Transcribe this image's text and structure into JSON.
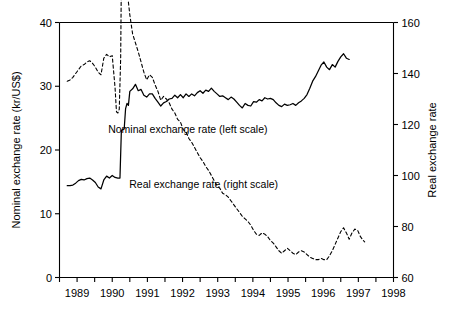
{
  "chart_data": {
    "type": "line",
    "title": "",
    "xlabel": "",
    "ylabel": "Nominal exchange rate (kr/US$)",
    "y2label": "Real exchange rate",
    "xlim": [
      1988.5,
      1998.0
    ],
    "ylim": [
      0,
      40
    ],
    "y2lim": [
      60,
      160
    ],
    "grid": false,
    "legend_position": "inside-annotations",
    "xticks": [
      1988.5,
      1989.0,
      1989.5,
      1990.0,
      1990.5,
      1991.0,
      1991.5,
      1992.0,
      1992.5,
      1993.0,
      1993.5,
      1994.0,
      1994.5,
      1995.0,
      1995.5,
      1996.0,
      1996.5,
      1997.0,
      1997.5,
      1998.0
    ],
    "xtick_labels": [
      "1989",
      "1990",
      "1991",
      "1992",
      "1993",
      "1994",
      "1995",
      "1996",
      "1997",
      "1998"
    ],
    "xtick_label_positions": [
      1989.0,
      1990.0,
      1991.0,
      1992.0,
      1993.0,
      1994.0,
      1995.0,
      1996.0,
      1997.0,
      1998.0
    ],
    "yticks": [
      0,
      10,
      20,
      30,
      40
    ],
    "ytick_labels": [
      "0",
      "10",
      "20",
      "30",
      "40"
    ],
    "y2ticks": [
      60,
      80,
      100,
      120,
      140,
      160
    ],
    "y2tick_labels": [
      "60",
      "80",
      "100",
      "120",
      "140",
      "160"
    ],
    "annotations": [
      {
        "text": "Nominal exchange rate (left scale)",
        "x": 1992.15,
        "y": 22.6
      },
      {
        "text": "Real exchange rate (right scale)",
        "x": 1992.6,
        "y": 14.1
      }
    ],
    "series": [
      {
        "name": "Nominal exchange rate (left scale)",
        "axis": "left",
        "style": "solid",
        "color": "#000000",
        "points": [
          [
            1988.72,
            14.4
          ],
          [
            1988.8,
            14.4
          ],
          [
            1988.88,
            14.5
          ],
          [
            1988.96,
            14.8
          ],
          [
            1989.04,
            15.2
          ],
          [
            1989.12,
            15.4
          ],
          [
            1989.2,
            15.3
          ],
          [
            1989.28,
            15.5
          ],
          [
            1989.36,
            15.6
          ],
          [
            1989.44,
            15.3
          ],
          [
            1989.52,
            14.9
          ],
          [
            1989.6,
            14.2
          ],
          [
            1989.68,
            13.9
          ],
          [
            1989.76,
            15.3
          ],
          [
            1989.84,
            15.9
          ],
          [
            1989.92,
            15.6
          ],
          [
            1990.0,
            16.0
          ],
          [
            1990.08,
            15.7
          ],
          [
            1990.16,
            15.6
          ],
          [
            1990.22,
            15.6
          ],
          [
            1990.26,
            23.1
          ],
          [
            1990.3,
            23.2
          ],
          [
            1990.34,
            23.3
          ],
          [
            1990.38,
            26.5
          ],
          [
            1990.42,
            27.3
          ],
          [
            1990.46,
            27.0
          ],
          [
            1990.5,
            29.2
          ],
          [
            1990.58,
            29.6
          ],
          [
            1990.66,
            30.3
          ],
          [
            1990.74,
            29.3
          ],
          [
            1990.82,
            29.5
          ],
          [
            1990.9,
            28.6
          ],
          [
            1990.98,
            28.3
          ],
          [
            1991.06,
            28.8
          ],
          [
            1991.14,
            28.8
          ],
          [
            1991.22,
            28.1
          ],
          [
            1991.3,
            27.5
          ],
          [
            1991.38,
            26.9
          ],
          [
            1991.46,
            27.4
          ],
          [
            1991.54,
            27.6
          ],
          [
            1991.62,
            28.0
          ],
          [
            1991.7,
            28.1
          ],
          [
            1991.78,
            28.6
          ],
          [
            1991.86,
            28.2
          ],
          [
            1991.94,
            28.7
          ],
          [
            1992.02,
            28.2
          ],
          [
            1992.1,
            28.8
          ],
          [
            1992.18,
            28.4
          ],
          [
            1992.26,
            28.8
          ],
          [
            1992.34,
            28.5
          ],
          [
            1992.42,
            29.0
          ],
          [
            1992.5,
            29.3
          ],
          [
            1992.58,
            28.9
          ],
          [
            1992.66,
            29.4
          ],
          [
            1992.74,
            29.2
          ],
          [
            1992.82,
            29.7
          ],
          [
            1992.9,
            29.2
          ],
          [
            1992.98,
            28.8
          ],
          [
            1993.06,
            28.4
          ],
          [
            1993.14,
            28.5
          ],
          [
            1993.22,
            28.2
          ],
          [
            1993.3,
            27.9
          ],
          [
            1993.38,
            28.3
          ],
          [
            1993.46,
            28.0
          ],
          [
            1993.54,
            27.5
          ],
          [
            1993.62,
            27.0
          ],
          [
            1993.7,
            26.6
          ],
          [
            1993.78,
            27.3
          ],
          [
            1993.86,
            27.0
          ],
          [
            1993.94,
            26.9
          ],
          [
            1994.02,
            27.6
          ],
          [
            1994.1,
            27.5
          ],
          [
            1994.18,
            27.9
          ],
          [
            1994.26,
            27.7
          ],
          [
            1994.34,
            28.2
          ],
          [
            1994.42,
            28.0
          ],
          [
            1994.5,
            28.1
          ],
          [
            1994.58,
            27.9
          ],
          [
            1994.66,
            27.4
          ],
          [
            1994.74,
            27.0
          ],
          [
            1994.82,
            26.8
          ],
          [
            1994.9,
            27.2
          ],
          [
            1994.98,
            27.0
          ],
          [
            1995.06,
            27.1
          ],
          [
            1995.14,
            27.3
          ],
          [
            1995.22,
            27.0
          ],
          [
            1995.3,
            27.4
          ],
          [
            1995.38,
            27.7
          ],
          [
            1995.46,
            28.1
          ],
          [
            1995.54,
            28.7
          ],
          [
            1995.62,
            29.7
          ],
          [
            1995.7,
            30.8
          ],
          [
            1995.78,
            31.5
          ],
          [
            1995.86,
            32.4
          ],
          [
            1995.94,
            33.3
          ],
          [
            1996.02,
            33.8
          ],
          [
            1996.1,
            33.0
          ],
          [
            1996.18,
            32.6
          ],
          [
            1996.26,
            33.4
          ],
          [
            1996.34,
            33.0
          ],
          [
            1996.42,
            33.9
          ],
          [
            1996.5,
            34.6
          ],
          [
            1996.58,
            35.1
          ],
          [
            1996.66,
            34.4
          ],
          [
            1996.74,
            34.2
          ]
        ]
      },
      {
        "name": "Real exchange rate (right scale)",
        "axis": "right",
        "style": "dashed",
        "color": "#000000",
        "points": [
          [
            1988.72,
            137.0
          ],
          [
            1988.8,
            137.5
          ],
          [
            1988.88,
            138.5
          ],
          [
            1988.96,
            140.0
          ],
          [
            1989.04,
            141.5
          ],
          [
            1989.12,
            143.0
          ],
          [
            1989.2,
            143.5
          ],
          [
            1989.28,
            144.5
          ],
          [
            1989.36,
            145.0
          ],
          [
            1989.44,
            144.0
          ],
          [
            1989.52,
            142.5
          ],
          [
            1989.6,
            140.5
          ],
          [
            1989.68,
            139.5
          ],
          [
            1989.76,
            146.0
          ],
          [
            1989.84,
            147.5
          ],
          [
            1989.92,
            146.5
          ],
          [
            1990.0,
            147.0
          ],
          [
            1990.08,
            134.5
          ],
          [
            1990.12,
            125.0
          ],
          [
            1990.16,
            124.5
          ],
          [
            1990.2,
            126.0
          ],
          [
            1990.24,
            146.0
          ],
          [
            1990.26,
            178.0
          ],
          [
            1990.28,
            190.0
          ],
          [
            1990.3,
            188.0
          ],
          [
            1990.34,
            184.0
          ],
          [
            1990.38,
            178.0
          ],
          [
            1990.42,
            172.0
          ],
          [
            1990.46,
            168.0
          ],
          [
            1990.5,
            163.0
          ],
          [
            1990.58,
            155.5
          ],
          [
            1990.66,
            152.0
          ],
          [
            1990.74,
            148.5
          ],
          [
            1990.82,
            144.5
          ],
          [
            1990.9,
            140.5
          ],
          [
            1990.98,
            137.5
          ],
          [
            1991.06,
            139.5
          ],
          [
            1991.14,
            138.5
          ],
          [
            1991.22,
            135.5
          ],
          [
            1991.3,
            133.0
          ],
          [
            1991.38,
            129.5
          ],
          [
            1991.46,
            131.0
          ],
          [
            1991.54,
            130.0
          ],
          [
            1991.62,
            128.5
          ],
          [
            1991.7,
            126.0
          ],
          [
            1991.78,
            124.5
          ],
          [
            1991.86,
            122.0
          ],
          [
            1991.94,
            121.0
          ],
          [
            1992.02,
            118.0
          ],
          [
            1992.1,
            117.0
          ],
          [
            1992.18,
            114.5
          ],
          [
            1992.26,
            113.0
          ],
          [
            1992.34,
            111.0
          ],
          [
            1992.42,
            109.0
          ],
          [
            1992.5,
            107.0
          ],
          [
            1992.58,
            105.5
          ],
          [
            1992.66,
            103.5
          ],
          [
            1992.74,
            102.0
          ],
          [
            1992.82,
            100.0
          ],
          [
            1992.9,
            98.0
          ],
          [
            1992.98,
            96.0
          ],
          [
            1993.06,
            95.0
          ],
          [
            1993.14,
            93.0
          ],
          [
            1993.22,
            92.5
          ],
          [
            1993.3,
            91.5
          ],
          [
            1993.38,
            90.0
          ],
          [
            1993.46,
            88.5
          ],
          [
            1993.54,
            87.0
          ],
          [
            1993.62,
            85.5
          ],
          [
            1993.7,
            84.0
          ],
          [
            1993.78,
            83.0
          ],
          [
            1993.86,
            82.0
          ],
          [
            1993.94,
            80.5
          ],
          [
            1994.02,
            78.5
          ],
          [
            1994.1,
            77.0
          ],
          [
            1994.18,
            76.5
          ],
          [
            1994.26,
            77.5
          ],
          [
            1994.34,
            77.0
          ],
          [
            1994.42,
            76.0
          ],
          [
            1994.5,
            74.5
          ],
          [
            1994.58,
            73.5
          ],
          [
            1994.66,
            72.0
          ],
          [
            1994.74,
            70.5
          ],
          [
            1994.82,
            69.5
          ],
          [
            1994.9,
            70.5
          ],
          [
            1994.98,
            71.5
          ],
          [
            1995.06,
            70.5
          ],
          [
            1995.14,
            69.5
          ],
          [
            1995.22,
            69.0
          ],
          [
            1995.3,
            70.0
          ],
          [
            1995.38,
            70.5
          ],
          [
            1995.46,
            70.0
          ],
          [
            1995.54,
            69.0
          ],
          [
            1995.62,
            68.0
          ],
          [
            1995.7,
            67.5
          ],
          [
            1995.78,
            67.0
          ],
          [
            1995.86,
            67.0
          ],
          [
            1995.94,
            67.5
          ],
          [
            1996.02,
            67.0
          ],
          [
            1996.1,
            67.0
          ],
          [
            1996.18,
            68.5
          ],
          [
            1996.26,
            70.5
          ],
          [
            1996.34,
            73.0
          ],
          [
            1996.42,
            75.5
          ],
          [
            1996.5,
            78.0
          ],
          [
            1996.58,
            79.5
          ],
          [
            1996.66,
            77.5
          ],
          [
            1996.74,
            75.0
          ],
          [
            1996.82,
            77.5
          ],
          [
            1996.9,
            79.0
          ],
          [
            1996.98,
            78.5
          ],
          [
            1997.06,
            76.0
          ],
          [
            1997.14,
            74.5
          ],
          [
            1997.18,
            74.0
          ]
        ]
      }
    ]
  }
}
